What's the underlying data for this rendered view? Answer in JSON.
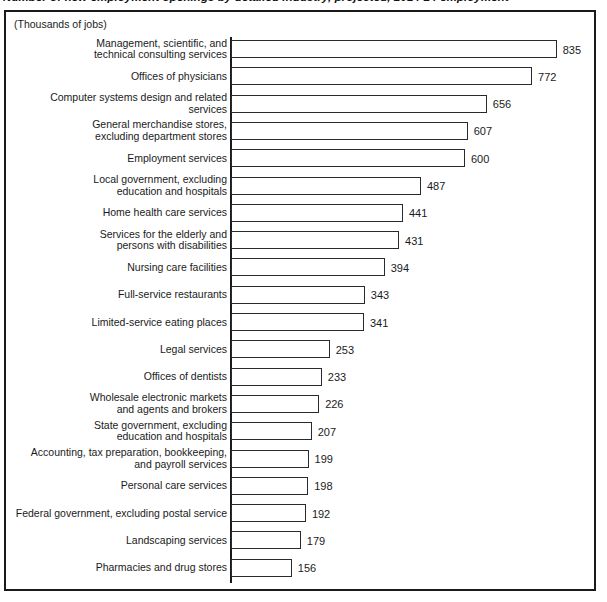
{
  "figure": {
    "title_clipped": "Number of new employment openings by detailed industry, projected, 2014-24 employment",
    "subtitle": "(Thousands of jobs)"
  },
  "chart_data": {
    "type": "bar",
    "orientation": "horizontal",
    "title": "",
    "subtitle": "(Thousands of jobs)",
    "xlabel": "",
    "ylabel": "",
    "xlim": [
      0,
      900
    ],
    "grid": false,
    "legend": false,
    "value_labels": true,
    "bar_style": {
      "fill": "#ffffff",
      "edge": "#2a2a2a"
    },
    "categories": [
      "Management, scientific, and\ntechnical consulting services",
      "Offices of physicians",
      "Computer systems design and related services",
      "General merchandise stores,\nexcluding department stores",
      "Employment services",
      "Local government, excluding\neducation and hospitals",
      "Home health care services",
      "Services for the elderly and\npersons with disabilities",
      "Nursing care facilities",
      "Full-service restaurants",
      "Limited-service eating places",
      "Legal services",
      "Offices of dentists",
      "Wholesale electronic markets\nand agents and brokers",
      "State government, excluding\neducation and hospitals",
      "Accounting, tax preparation, bookkeeping,\nand payroll services",
      "Personal care services",
      "Federal government, excluding postal service",
      "Landscaping services",
      "Pharmacies and drug stores"
    ],
    "values": [
      835,
      772,
      656,
      607,
      600,
      487,
      441,
      431,
      394,
      343,
      341,
      253,
      233,
      226,
      207,
      199,
      198,
      192,
      179,
      156
    ],
    "value_strings": [
      "835",
      "772",
      "656",
      "607",
      "600",
      "487",
      "441",
      "431",
      "394",
      "343",
      "341",
      "253",
      "233",
      "226",
      "207",
      "199",
      "198",
      "192",
      "179",
      "156"
    ]
  }
}
